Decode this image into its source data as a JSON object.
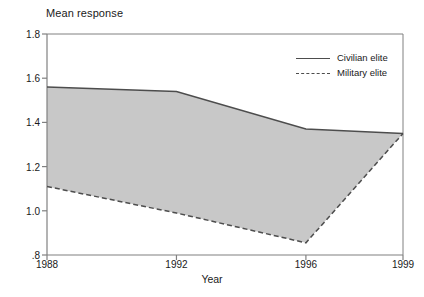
{
  "chart_data": {
    "type": "line",
    "title": "Mean response",
    "xlabel": "Year",
    "ylabel": "",
    "x": [
      1988,
      1992,
      1996,
      1999
    ],
    "categories": [
      "1988",
      "1992",
      "1996",
      "1999"
    ],
    "series": [
      {
        "name": "Civilian elite",
        "style": "solid",
        "values": [
          1.56,
          1.54,
          1.37,
          1.35
        ]
      },
      {
        "name": "Military elite",
        "style": "dashed",
        "values": [
          1.11,
          0.99,
          0.855,
          1.35
        ]
      }
    ],
    "ylim": [
      0.8,
      1.8
    ],
    "xlim": [
      1988,
      1999
    ],
    "ytick_labels": [
      "1.8",
      "1.6",
      "1.4",
      "1.2",
      "1.0",
      ".8"
    ],
    "ytick_values": [
      1.8,
      1.6,
      1.4,
      1.2,
      1.0,
      0.8
    ],
    "xtick_labels": [
      "1988",
      "1992",
      "1996",
      "1999"
    ],
    "xtick_values": [
      1988,
      1992,
      1996,
      1999
    ],
    "grid": false,
    "legend_position": "top-right-inside",
    "fill_between": true,
    "fill_color": "#c8c8c8",
    "line_color": "#4d4d4d",
    "axis_color": "#808080"
  },
  "title": {
    "text": "Mean response"
  },
  "axes": {
    "x_label": "Year"
  },
  "legend": {
    "items": [
      {
        "label": "Civilian elite",
        "style": "solid"
      },
      {
        "label": "Military elite",
        "style": "dashed"
      }
    ]
  },
  "colors": {
    "fill": "#c8c8c8",
    "line": "#4d4d4d",
    "axis": "#808080",
    "text": "#1a1a1a"
  }
}
